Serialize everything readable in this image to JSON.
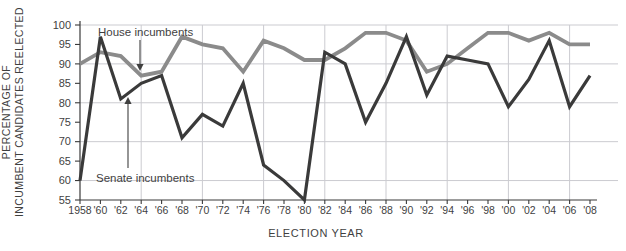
{
  "chart_data": {
    "type": "line",
    "title": "",
    "xlabel": "ELECTION YEAR",
    "ylabel_line1": "PERCENTAGE OF",
    "ylabel_line2": "INCUMBENT CANDIDATES REELECTED",
    "x_labels": [
      "1958",
      "'60",
      "'62",
      "'64",
      "'66",
      "'68",
      "'70",
      "'72",
      "'74",
      "'76",
      "'78",
      "'80",
      "'82",
      "'84",
      "'86",
      "'88",
      "'90",
      "'92",
      "'94",
      "'96",
      "'98",
      "'00",
      "'02",
      "'04",
      "'06",
      "'08"
    ],
    "y_ticks": [
      55,
      60,
      65,
      70,
      75,
      80,
      85,
      90,
      95,
      100
    ],
    "ylim": [
      55,
      100
    ],
    "h_gridlines": [
      60,
      70,
      80,
      90,
      100
    ],
    "v_gridline_indices": [
      3,
      6,
      9,
      12,
      15,
      18,
      21,
      24
    ],
    "grid": "on",
    "legend_position": "inline-annotations",
    "series": [
      {
        "name": "House incumbents",
        "color": "#8b8b8b",
        "stroke_width": 3.8,
        "values": [
          90,
          93,
          92,
          87,
          88,
          97,
          95,
          94,
          88,
          96,
          94,
          91,
          91,
          94,
          98,
          98,
          96,
          88,
          90,
          94,
          98,
          98,
          96,
          98,
          95,
          95
        ]
      },
      {
        "name": "Senate incumbents",
        "color": "#3a3a3a",
        "stroke_width": 3.2,
        "values": [
          60,
          97,
          81,
          85,
          87,
          71,
          77,
          74,
          85,
          64,
          60,
          55,
          93,
          90,
          75,
          85,
          97,
          82,
          92,
          91,
          90,
          79,
          86,
          96,
          79,
          87
        ]
      }
    ]
  },
  "colors": {
    "house_line": "#8b8b8b",
    "senate_line": "#3a3a3a",
    "gridline": "#cbcbd0",
    "axis": "#3a3a3a",
    "text": "#3f3f3f",
    "background": "#ffffff"
  }
}
